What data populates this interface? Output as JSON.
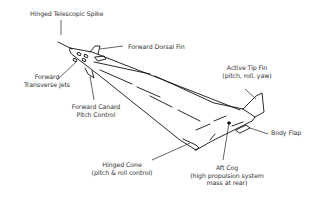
{
  "diagram": {
    "type": "vehicle-callout-diagram",
    "stroke_color": "#111111",
    "text_color": "#333333",
    "labels": {
      "spike": "Hinged Telescopic Spike",
      "dorsal_fin": "Forward Dorsal Fin",
      "transverse_jets_1": "Forward",
      "transverse_jets_2": "Transverse Jets",
      "canard_1": "Forward Canard",
      "canard_2": "Pitch Control",
      "tip_fin_1": "Active Tip Fin",
      "tip_fin_2": "(pitch, roll, yaw)",
      "body_flap": "Body Flap",
      "cone_1": "Hinged Cone",
      "cone_2": "(pitch & roll control)",
      "aft_cog_1": "Aft Cog",
      "aft_cog_2": "(high propulsion system",
      "aft_cog_3": "mass at rear)"
    }
  }
}
